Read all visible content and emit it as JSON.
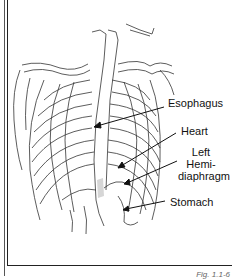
{
  "figure": {
    "caption": "Fig. 1.1-6",
    "labels": [
      {
        "id": "esophagus",
        "text": "Esophagus"
      },
      {
        "id": "heart",
        "text": "Heart"
      },
      {
        "id": "left-hemidiaphragm",
        "line1": "Left",
        "line2": "Hemi-",
        "line3": "diaphragm"
      },
      {
        "id": "stomach",
        "text": "Stomach"
      }
    ],
    "colors": {
      "line": "#222222",
      "background": "#ffffff",
      "shade": "#d6d6d6"
    }
  }
}
